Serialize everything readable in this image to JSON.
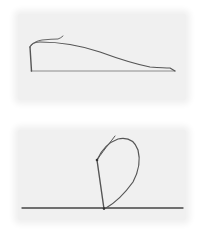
{
  "figures": [
    {
      "id": "top",
      "description": "Line sketch: vertical stem rising from baseline with a long tapering curve descending to the right",
      "colors": {
        "panel": "#f0f0f0",
        "stroke": "#555555",
        "baseline": "#777777"
      }
    },
    {
      "id": "bottom",
      "description": "Line sketch: slanted stem from baseline with a teardrop loop curving up and back down to the base",
      "colors": {
        "panel": "#efefef",
        "stroke": "#555555",
        "baseline": "#444444"
      }
    }
  ]
}
